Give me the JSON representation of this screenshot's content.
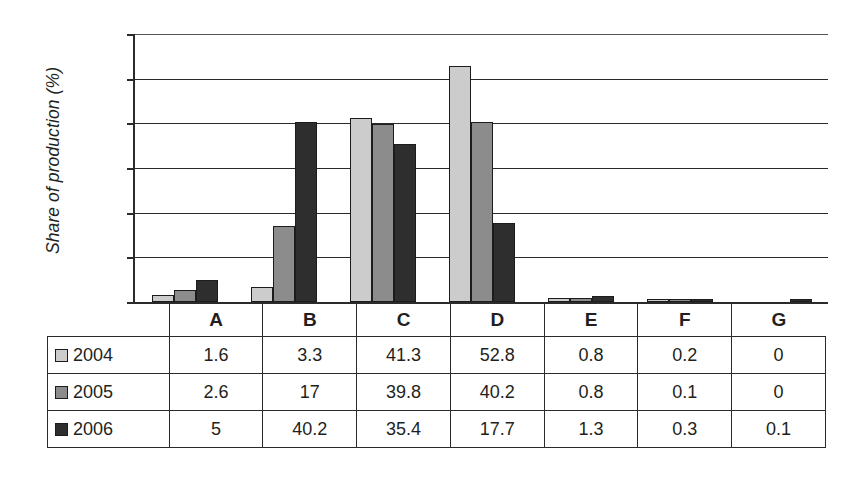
{
  "chart_data": {
    "type": "bar",
    "title": "",
    "xlabel": "",
    "ylabel": "Share of production (%)",
    "ylim": [
      0,
      60
    ],
    "yticks": [
      0,
      10,
      20,
      30,
      40,
      50,
      60
    ],
    "grid": true,
    "legend_position": "table-row-headers",
    "categories": [
      "A",
      "B",
      "C",
      "D",
      "E",
      "F",
      "G"
    ],
    "series": [
      {
        "name": "2004",
        "color": "#cccccc",
        "values": [
          1.6,
          3.3,
          41.3,
          52.8,
          0.8,
          0.2,
          0
        ]
      },
      {
        "name": "2005",
        "color": "#8c8c8c",
        "values": [
          2.6,
          17,
          39.8,
          40.2,
          0.8,
          0.1,
          0
        ]
      },
      {
        "name": "2006",
        "color": "#2e2e2e",
        "values": [
          5,
          40.2,
          35.4,
          17.7,
          1.3,
          0.3,
          0.1
        ]
      }
    ]
  },
  "axis": {
    "y_title": "Share of production (%)",
    "tick_labels": [
      "60",
      "50",
      "40",
      "30",
      "20",
      "10",
      "0"
    ]
  },
  "table": {
    "corner_label": "",
    "column_headers": [
      "A",
      "B",
      "C",
      "D",
      "E",
      "F",
      "G"
    ],
    "rows": [
      {
        "label": "2004",
        "swatch": "legend-swatch-2004",
        "cells": [
          "1.6",
          "3.3",
          "41.3",
          "52.8",
          "0.8",
          "0.2",
          "0"
        ]
      },
      {
        "label": "2005",
        "swatch": "legend-swatch-2005",
        "cells": [
          "2.6",
          "17",
          "39.8",
          "40.2",
          "0.8",
          "0.1",
          "0"
        ]
      },
      {
        "label": "2006",
        "swatch": "legend-swatch-2006",
        "cells": [
          "5",
          "40.2",
          "35.4",
          "17.7",
          "1.3",
          "0.3",
          "0.1"
        ]
      }
    ]
  },
  "colors": {
    "series_2004": "#cccccc",
    "series_2005": "#8c8c8c",
    "series_2006": "#2e2e2e",
    "axis": "#2b2b2b",
    "background": "#ffffff"
  }
}
